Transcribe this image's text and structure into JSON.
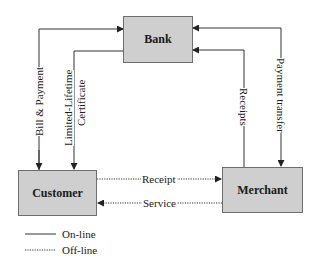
{
  "nodes": {
    "bank": {
      "label": "Bank"
    },
    "customer": {
      "label": "Customer"
    },
    "merchant": {
      "label": "Merchant"
    }
  },
  "edges": {
    "bill_payment": {
      "label": "Bill & Payment",
      "from": "Customer",
      "to": "Bank",
      "style": "solid"
    },
    "certificate": {
      "label_line1": "Limited-Lifetime",
      "label_line2": "Certificate",
      "from": "Bank",
      "to": "Customer",
      "style": "solid"
    },
    "receipts": {
      "label": "Receipts",
      "from": "Merchant",
      "to": "Bank",
      "style": "solid"
    },
    "payment_transfer": {
      "label": "Payment transfer",
      "from": "Bank",
      "to": "Merchant",
      "style": "solid",
      "bidirectional": true
    },
    "receipt": {
      "label": "Receipt",
      "from": "Customer",
      "to": "Merchant",
      "style": "dotted"
    },
    "service": {
      "label": "Service",
      "from": "Merchant",
      "to": "Customer",
      "style": "dotted"
    }
  },
  "legend": {
    "online": "On-line",
    "offline": "Off-line"
  },
  "colors": {
    "box_fill": "#cfcfcf",
    "box_border": "#6e6e6e",
    "line": "#333333"
  }
}
